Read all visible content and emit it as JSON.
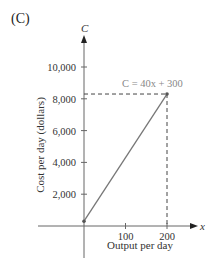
{
  "panel_label": "(C)",
  "chart_data": {
    "type": "line",
    "title": "",
    "xlabel": "Output per day",
    "ylabel": "Cost per day (dollars)",
    "x_axis_var": "x",
    "y_axis_var": "C",
    "xticks": [
      100,
      200
    ],
    "xtick_labels": [
      "100",
      "200"
    ],
    "yticks": [
      2000,
      4000,
      6000,
      8000,
      10000
    ],
    "ytick_labels": [
      "2,000",
      "4,000",
      "6,000",
      "8,000",
      "10,000"
    ],
    "xlim": [
      -80,
      240
    ],
    "ylim": [
      -3000,
      12000
    ],
    "grid": false,
    "series": [
      {
        "name": "C = 40x + 300",
        "equation": "C = 40x + 300",
        "x": [
          0,
          200
        ],
        "y": [
          300,
          8300
        ],
        "color": "#777777"
      }
    ],
    "annotations": [
      {
        "text": "C = 40x + 300",
        "x": 200,
        "y": 8300,
        "color": "#888888"
      }
    ],
    "reference_lines": [
      {
        "type": "dashed",
        "from": [
          0,
          8300
        ],
        "to": [
          200,
          8300
        ]
      },
      {
        "type": "dashed",
        "from": [
          200,
          8300
        ],
        "to": [
          200,
          0
        ]
      }
    ],
    "points": [
      {
        "x": 0,
        "y": 300
      },
      {
        "x": 200,
        "y": 8300
      }
    ]
  }
}
